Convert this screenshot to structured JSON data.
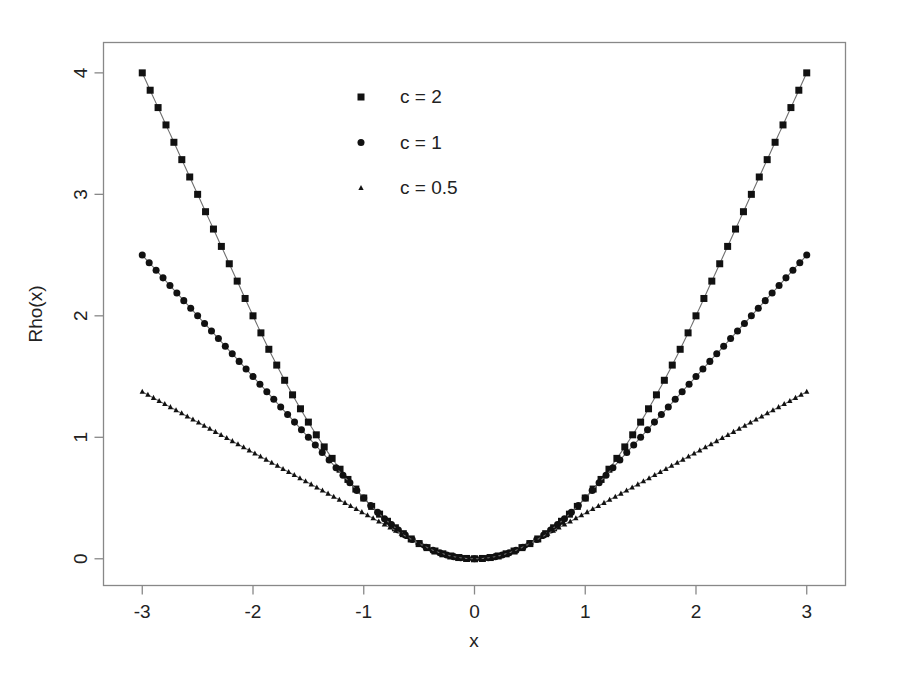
{
  "chart_data": {
    "type": "line",
    "title": "",
    "subtitle": "",
    "xlabel": "x",
    "ylabel": "Rho(x)",
    "xlim": [
      -3.35,
      3.35
    ],
    "ylim": [
      -0.22,
      4.25
    ],
    "xticks": [
      -3,
      -2,
      -1,
      0,
      1,
      2,
      3
    ],
    "xtick_labels": [
      "-3",
      "-2",
      "-1",
      "0",
      "1",
      "2",
      "3"
    ],
    "yticks": [
      0,
      1,
      2,
      3,
      4
    ],
    "ytick_labels": [
      "0",
      "1",
      "2",
      "3",
      "4"
    ],
    "grid": false,
    "legend_position": "top-center-left",
    "function_description": "Huber loss rho(x) = x^2/2 for |x| <= c, else c*(|x| - c/2)",
    "series": [
      {
        "name": "c = 2",
        "marker": "square",
        "c": 2,
        "x": [
          -3,
          -2.8,
          -2.6,
          -2.4,
          -2.2,
          -2,
          -1.8,
          -1.6,
          -1.4,
          -1.2,
          -1,
          -0.8,
          -0.6,
          -0.4,
          -0.2,
          0,
          0.2,
          0.4,
          0.6,
          0.8,
          1,
          1.2,
          1.4,
          1.6,
          1.8,
          2,
          2.2,
          2.4,
          2.6,
          2.8,
          3
        ],
        "values": [
          4,
          3.6,
          3.2,
          2.8,
          2.4,
          2,
          1.62,
          1.28,
          0.98,
          0.72,
          0.5,
          0.32,
          0.18,
          0.08,
          0.02,
          0,
          0.02,
          0.08,
          0.18,
          0.32,
          0.5,
          0.72,
          0.98,
          1.28,
          1.62,
          2,
          2.4,
          2.8,
          3.2,
          3.6,
          4
        ]
      },
      {
        "name": "c = 1",
        "marker": "circle",
        "c": 1,
        "x": [
          -3,
          -2.8,
          -2.6,
          -2.4,
          -2.2,
          -2,
          -1.8,
          -1.6,
          -1.4,
          -1.2,
          -1,
          -0.8,
          -0.6,
          -0.4,
          -0.2,
          0,
          0.2,
          0.4,
          0.6,
          0.8,
          1,
          1.2,
          1.4,
          1.6,
          1.8,
          2,
          2.2,
          2.4,
          2.6,
          2.8,
          3
        ],
        "values": [
          2.5,
          2.3,
          2.1,
          1.9,
          1.7,
          1.5,
          1.3,
          1.1,
          0.9,
          0.7,
          0.5,
          0.32,
          0.18,
          0.08,
          0.02,
          0,
          0.02,
          0.08,
          0.18,
          0.32,
          0.5,
          0.7,
          0.9,
          1.1,
          1.3,
          1.5,
          1.7,
          1.9,
          2.1,
          2.3,
          2.5
        ]
      },
      {
        "name": "c = 0.5",
        "marker": "triangle",
        "c": 0.5,
        "x": [
          -3,
          -2.8,
          -2.6,
          -2.4,
          -2.2,
          -2,
          -1.8,
          -1.6,
          -1.4,
          -1.2,
          -1,
          -0.8,
          -0.6,
          -0.4,
          -0.2,
          0,
          0.2,
          0.4,
          0.6,
          0.8,
          1,
          1.2,
          1.4,
          1.6,
          1.8,
          2,
          2.2,
          2.4,
          2.6,
          2.8,
          3
        ],
        "values": [
          1.375,
          1.275,
          1.175,
          1.075,
          0.975,
          0.875,
          0.775,
          0.675,
          0.575,
          0.475,
          0.375,
          0.275,
          0.175,
          0.08,
          0.02,
          0,
          0.02,
          0.08,
          0.175,
          0.275,
          0.375,
          0.475,
          0.575,
          0.675,
          0.775,
          0.875,
          0.975,
          1.075,
          1.175,
          1.275,
          1.375
        ]
      }
    ],
    "legend": [
      {
        "label": "c = 2",
        "marker": "square"
      },
      {
        "label": "c = 1",
        "marker": "circle"
      },
      {
        "label": "c = 0.5",
        "marker": "triangle"
      }
    ],
    "colors": {
      "marker": "#111111",
      "line": "#6f6f6f",
      "frame": "#888888",
      "text": "#222222",
      "background": "#ffffff"
    }
  }
}
